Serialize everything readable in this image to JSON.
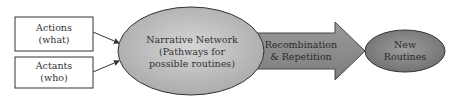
{
  "boxes": [
    {
      "line1": "Actions",
      "line2": "(what)"
    },
    {
      "line1": "Actants",
      "line2": "(who)"
    }
  ],
  "network": {
    "line1": "Narrative Network",
    "line2": "(Pathways for",
    "line3": "possible routines)"
  },
  "arrow": {
    "line1": "Recombination",
    "line2": "& Repetition"
  },
  "routines": {
    "line1": "New",
    "line2": "Routines"
  },
  "colors": {
    "ellipse_fill": "#bdbdbd",
    "arrow_fill": "#8f8f8f",
    "small_ellipse_fill": "#8a8a8a",
    "stroke": "#333333"
  }
}
